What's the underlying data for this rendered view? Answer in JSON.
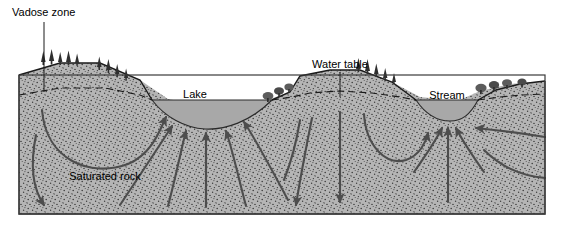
{
  "figure": {
    "title_semantic": "groundwater-flow-cross-section",
    "labels": {
      "vadose_zone": "Vadose zone",
      "lake": "Lake",
      "water_table": "Water table",
      "stream": "Stream",
      "saturated_rock": "Saturated rock"
    },
    "colors": {
      "ground_fill": "#b5b5b5",
      "stipple_dot": "#3a3a3a",
      "water_fill": "#a8a8a8",
      "outline": "#1a1a1a",
      "arrow": "#4d4d4d",
      "tree_dark": "#2e2e2e",
      "tree_gray": "#6e6e6e",
      "background": "#ffffff",
      "vadose_band": "#c9c9c9"
    },
    "features": {
      "water_bodies": [
        "Lake",
        "Stream"
      ],
      "zones": [
        "Vadose zone",
        "Saturated rock"
      ],
      "boundary": "Water table",
      "flow_indication": "arrows showing groundwater flow from recharge highs toward lake and stream discharge"
    }
  }
}
